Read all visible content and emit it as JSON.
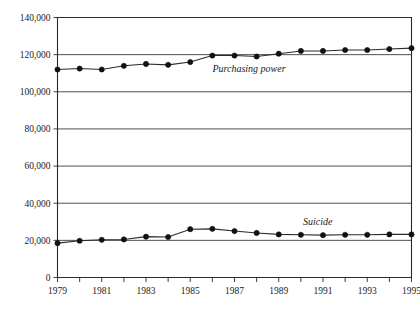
{
  "chart_data": {
    "type": "line",
    "title": "",
    "subtitle": "",
    "xlabel": "",
    "ylabel": "",
    "x": [
      1979,
      1980,
      1981,
      1982,
      1983,
      1984,
      1985,
      1986,
      1987,
      1988,
      1989,
      1990,
      1991,
      1992,
      1993,
      1994,
      1995
    ],
    "categories": [
      "1979",
      "1980",
      "1981",
      "1982",
      "1983",
      "1984",
      "1985",
      "1986",
      "1987",
      "1988",
      "1989",
      "1990",
      "1991",
      "1992",
      "1993",
      "1994",
      "1995"
    ],
    "xlim": [
      1979,
      1995
    ],
    "ylim": [
      0,
      140000
    ],
    "y_ticks": [
      0,
      20000,
      40000,
      60000,
      80000,
      100000,
      120000,
      140000
    ],
    "y_tick_labels": [
      "0",
      "20,000",
      "40,000",
      "60,000",
      "80,000",
      "100,000",
      "120,000",
      "140,000"
    ],
    "x_tick_labels_shown": [
      "1979",
      "",
      "1981",
      "",
      "1983",
      "",
      "1985",
      "",
      "1987",
      "",
      "1989",
      "",
      "1991",
      "",
      "1993",
      "",
      "1995"
    ],
    "grid": true,
    "grid_orientation": "horizontal",
    "legend": "inline-labels",
    "marker": "filled-circle",
    "series": [
      {
        "name": "Purchasing power",
        "label": "Purchasing power",
        "label_x": 1986.0,
        "label_y": 110500,
        "color": "#2b2b2b",
        "values": [
          112000,
          112500,
          112000,
          114000,
          115000,
          114500,
          116000,
          119500,
          119500,
          119000,
          120500,
          122000,
          122000,
          122500,
          122500,
          123000,
          123500
        ]
      },
      {
        "name": "Suicide",
        "label": "Suicide",
        "label_x": 1990.1,
        "label_y": 28500,
        "color": "#2b2b2b",
        "values": [
          18500,
          19800,
          20300,
          20500,
          22000,
          21800,
          26000,
          26200,
          25000,
          24000,
          23200,
          23000,
          22800,
          23000,
          23000,
          23200,
          23200
        ]
      }
    ]
  },
  "axis": {
    "y_title": "",
    "x_title": ""
  }
}
